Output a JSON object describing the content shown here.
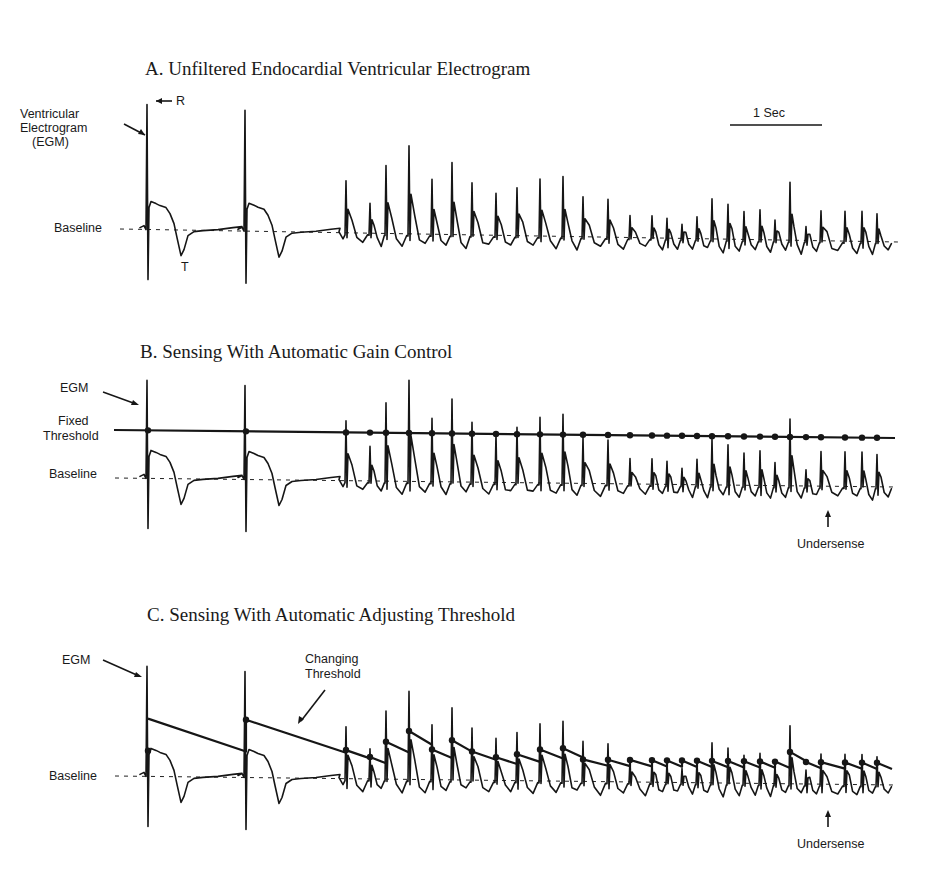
{
  "figure": {
    "panels": [
      {
        "id": "A",
        "title": "A. Unfiltered Endocardial Ventricular Electrogram",
        "labels": {
          "egm": [
            "Ventricular",
            "Electrogram",
            "(EGM)"
          ],
          "baseline": "Baseline",
          "r_wave": "R",
          "t_wave": "T",
          "scale": "1 Sec"
        }
      },
      {
        "id": "B",
        "title": "B. Sensing With Automatic Gain Control",
        "labels": {
          "egm": "EGM",
          "threshold": [
            "Fixed",
            "Threshold"
          ],
          "baseline": "Baseline",
          "undersense": "Undersense"
        }
      },
      {
        "id": "C",
        "title": "C. Sensing With Automatic Adjusting Threshold",
        "labels": {
          "egm": "EGM",
          "threshold": [
            "Changing",
            "Threshold"
          ],
          "baseline": "Baseline",
          "undersense": "Undersense"
        }
      }
    ]
  },
  "chart_data": {
    "type": "line",
    "xlabel": "time",
    "scale_bar": "1 Sec",
    "annotations": [
      "R",
      "T",
      "Baseline",
      "Fixed Threshold",
      "Changing Threshold",
      "Undersense"
    ],
    "sinus_beats": [
      {
        "x": 148,
        "label": "sinus beat 1 (R wave)"
      },
      {
        "x": 246,
        "label": "sinus beat 2"
      }
    ],
    "tachy_onset_x": 343,
    "tachy_beats_x": [
      346,
      370,
      386,
      409,
      432,
      452,
      472,
      496,
      517,
      540,
      563,
      583,
      608,
      630,
      652,
      667,
      682,
      697,
      712,
      728,
      744,
      760,
      775,
      790,
      806,
      821,
      845,
      862,
      877
    ],
    "tachy_peak_heights_A": [
      52,
      30,
      68,
      88,
      55,
      72,
      52,
      42,
      48,
      57,
      60,
      40,
      38,
      22,
      22,
      20,
      14,
      22,
      40,
      35,
      28,
      30,
      20,
      58,
      14,
      30,
      30,
      30,
      28
    ],
    "undersensed_beat_x": 828,
    "panel_B_fixed_threshold_y_offset": -38,
    "panel_C_threshold_decay": "exponential decay from 60% of preceding sensed peak toward baseline"
  },
  "colors": {
    "ink": "#161616",
    "background": "#ffffff"
  }
}
